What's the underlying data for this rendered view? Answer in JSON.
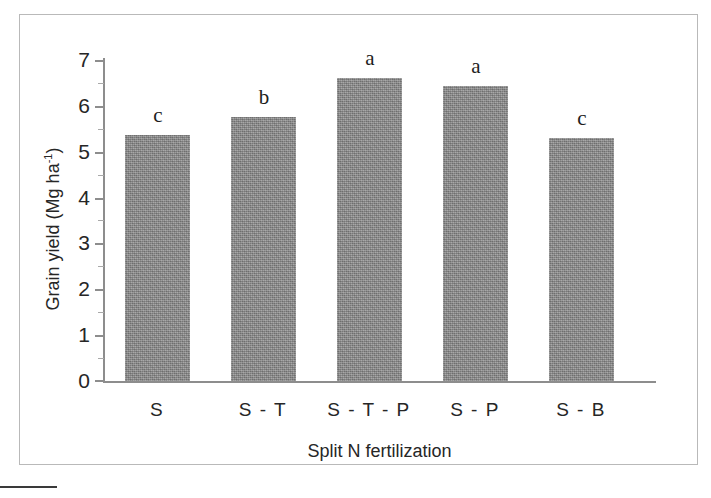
{
  "figure": {
    "frame_border_color": "#b9b9b9",
    "bar_color": "#8b8b8b",
    "axis_color": "#8d8d8d",
    "text_color": "#262626"
  },
  "chart_data": {
    "type": "bar",
    "title": "",
    "subtitle": "",
    "xlabel": "Split N fertilization",
    "ylabel": "Grain yield (Mg ha-1)",
    "ylabel_parts": {
      "main": "Grain yield (Mg ha",
      "sup": "-1",
      "tail": ")"
    },
    "categories": [
      "S",
      "S - T",
      "S - T - P",
      "S - P",
      "S - B"
    ],
    "values": [
      5.36,
      5.76,
      6.61,
      6.43,
      5.3
    ],
    "annotations": [
      "c",
      "b",
      "a",
      "a",
      "c"
    ],
    "ylim": [
      0,
      7
    ],
    "yticks": [
      0,
      1,
      2,
      3,
      4,
      5,
      6,
      7
    ],
    "ytick_labels": [
      "0",
      "1",
      "2",
      "3",
      "4",
      "5",
      "6",
      "7"
    ],
    "minor_ticks": [
      0.5,
      1.5,
      2.5,
      3.5,
      4.5,
      5.5,
      6.5
    ],
    "grid": false,
    "legend": null,
    "legend_position": "none"
  },
  "bars": [
    {
      "category": "S",
      "value": 5.36,
      "letter": "c"
    },
    {
      "category": "S - T",
      "value": 5.76,
      "letter": "b"
    },
    {
      "category": "S - T - P",
      "value": 6.61,
      "letter": "a"
    },
    {
      "category": "S - P",
      "value": 6.43,
      "letter": "a"
    },
    {
      "category": "S - B",
      "value": 5.3,
      "letter": "c"
    }
  ]
}
